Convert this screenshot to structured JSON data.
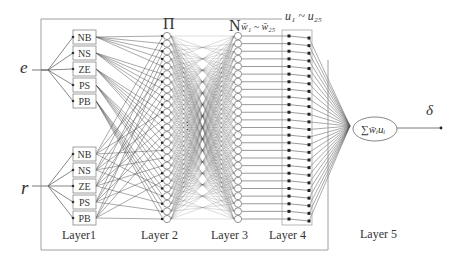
{
  "diagram": {
    "inputs": [
      {
        "name": "e",
        "label": "e"
      },
      {
        "name": "r",
        "label": "r"
      }
    ],
    "membership_labels": [
      "NB",
      "NS",
      "ZE",
      "PS",
      "PB"
    ],
    "layer_labels": [
      "Layer1",
      "Layer 2",
      "Layer 3",
      "Layer 4",
      "Layer 5"
    ],
    "layer2_symbol": "Π",
    "layer3_symbol": "N",
    "layer3_weights_label": "w̄₁ ~ w̄₂₅",
    "layer4_outputs_label": "u₁ ~ u₂₅",
    "layer2_ellipsis": "⋮",
    "output_node_label": "∑w̄ᵢuᵢ",
    "output_symbol": "δ",
    "rule_node_count": 25,
    "colors": {
      "line": "#555555",
      "frame": "#888888",
      "node_fill": "#ffffff",
      "text": "#333333"
    }
  }
}
